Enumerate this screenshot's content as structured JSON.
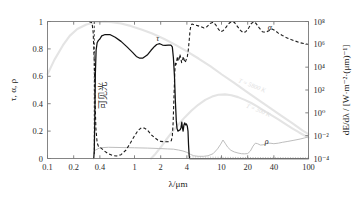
{
  "chart_data": {
    "type": "line",
    "title": "",
    "xlabel": "λ/μm",
    "ylabel_left": "τ, α, ρ",
    "ylabel_right": "dE/dλ / [W·m⁻²·(μm)⁻¹]",
    "xscale": "log",
    "xlim": [
      0.1,
      100
    ],
    "ylim_left": [
      0,
      1
    ],
    "ylim_right": [
      0.0001,
      100000000.0
    ],
    "grid": false,
    "legend_position": "inline-annotations",
    "xticks": [
      "0.1",
      "0.2",
      "0.4",
      "1",
      "2",
      "4",
      "10",
      "20",
      "40",
      "100"
    ],
    "xtick_values": [
      0.1,
      0.2,
      0.4,
      1,
      2,
      4,
      10,
      20,
      40,
      100
    ],
    "yticks_left": [
      "0",
      "0.2",
      "0.4",
      "0.6",
      "0.8",
      "1"
    ],
    "ytick_values_left": [
      0,
      0.2,
      0.4,
      0.6,
      0.8,
      1
    ],
    "yticks_right": [
      "10⁻⁴",
      "10⁻²",
      "10⁰",
      "10²",
      "10⁴",
      "10⁶",
      "10⁸"
    ],
    "ytick_values_right": [
      0.0001,
      0.01,
      1,
      100,
      10000,
      1000000,
      100000000
    ],
    "annotations": [
      {
        "name": "tau-label",
        "text": "τ",
        "x": 1.85,
        "y": 0.855
      },
      {
        "name": "alpha-label",
        "text": "α",
        "x": 36,
        "y": 0.935
      },
      {
        "name": "rho-label",
        "text": "ρ",
        "x": 33,
        "y": 0.105
      },
      {
        "name": "visible-light-label",
        "text": "可见光",
        "x": 0.47,
        "y": 0.46
      },
      {
        "name": "blackbody-5800-label",
        "text": "T = 5800 K",
        "x": 22,
        "y": 0.52
      },
      {
        "name": "blackbody-300-label",
        "text": "T = 300 K",
        "x": 26,
        "y": 0.34
      }
    ],
    "series": [
      {
        "name": "τ",
        "symbol": "tau",
        "style": "solid",
        "color": "#111111",
        "description": "Spectral transmissivity of glass",
        "points": [
          [
            0.34,
            0.0
          ],
          [
            0.345,
            0.06
          ],
          [
            0.35,
            0.3
          ],
          [
            0.355,
            0.62
          ],
          [
            0.362,
            0.79
          ],
          [
            0.372,
            0.845
          ],
          [
            0.385,
            0.862
          ],
          [
            0.4,
            0.872
          ],
          [
            0.42,
            0.895
          ],
          [
            0.46,
            0.905
          ],
          [
            0.52,
            0.905
          ],
          [
            0.6,
            0.885
          ],
          [
            0.7,
            0.855
          ],
          [
            0.82,
            0.815
          ],
          [
            0.95,
            0.775
          ],
          [
            1.05,
            0.745
          ],
          [
            1.15,
            0.732
          ],
          [
            1.25,
            0.733
          ],
          [
            1.4,
            0.755
          ],
          [
            1.55,
            0.79
          ],
          [
            1.7,
            0.818
          ],
          [
            1.8,
            0.832
          ],
          [
            1.95,
            0.838
          ],
          [
            2.1,
            0.828
          ],
          [
            2.25,
            0.825
          ],
          [
            2.45,
            0.828
          ],
          [
            2.62,
            0.828
          ],
          [
            2.72,
            0.815
          ],
          [
            2.8,
            0.735
          ],
          [
            2.88,
            0.6
          ],
          [
            2.95,
            0.42
          ],
          [
            3.02,
            0.28
          ],
          [
            3.08,
            0.22
          ],
          [
            3.15,
            0.2
          ],
          [
            3.25,
            0.205
          ],
          [
            3.35,
            0.21
          ],
          [
            3.42,
            0.225
          ],
          [
            3.5,
            0.265
          ],
          [
            3.55,
            0.225
          ],
          [
            3.62,
            0.2
          ],
          [
            3.7,
            0.245
          ],
          [
            3.78,
            0.26
          ],
          [
            3.86,
            0.245
          ],
          [
            3.95,
            0.252
          ],
          [
            4.05,
            0.235
          ],
          [
            4.12,
            0.2
          ],
          [
            4.18,
            0.1
          ],
          [
            4.25,
            0.02
          ],
          [
            4.3,
            0.0
          ],
          [
            100,
            0.0
          ]
        ]
      },
      {
        "name": "α",
        "symbol": "alpha",
        "style": "dashed",
        "color": "#1a1a1a",
        "description": "Spectral absorptivity of glass",
        "points": [
          [
            0.3,
            1.0
          ],
          [
            0.325,
            0.99
          ],
          [
            0.335,
            0.92
          ],
          [
            0.345,
            0.7
          ],
          [
            0.352,
            0.42
          ],
          [
            0.36,
            0.22
          ],
          [
            0.372,
            0.115
          ],
          [
            0.385,
            0.088
          ],
          [
            0.4,
            0.082
          ],
          [
            0.42,
            0.072
          ],
          [
            0.45,
            0.055
          ],
          [
            0.5,
            0.035
          ],
          [
            0.56,
            0.022
          ],
          [
            0.62,
            0.018
          ],
          [
            0.7,
            0.028
          ],
          [
            0.8,
            0.062
          ],
          [
            0.9,
            0.115
          ],
          [
            1.0,
            0.165
          ],
          [
            1.1,
            0.205
          ],
          [
            1.2,
            0.225
          ],
          [
            1.3,
            0.222
          ],
          [
            1.42,
            0.205
          ],
          [
            1.55,
            0.175
          ],
          [
            1.7,
            0.152
          ],
          [
            1.85,
            0.135
          ],
          [
            2.0,
            0.125
          ],
          [
            2.2,
            0.122
          ],
          [
            2.4,
            0.122
          ],
          [
            2.55,
            0.125
          ],
          [
            2.65,
            0.13
          ],
          [
            2.72,
            0.165
          ],
          [
            2.78,
            0.26
          ],
          [
            2.84,
            0.44
          ],
          [
            2.9,
            0.62
          ],
          [
            2.95,
            0.705
          ],
          [
            3.0,
            0.685
          ],
          [
            3.06,
            0.715
          ],
          [
            3.12,
            0.745
          ],
          [
            3.18,
            0.712
          ],
          [
            3.25,
            0.72
          ],
          [
            3.32,
            0.76
          ],
          [
            3.4,
            0.735
          ],
          [
            3.48,
            0.7
          ],
          [
            3.56,
            0.715
          ],
          [
            3.64,
            0.745
          ],
          [
            3.72,
            0.72
          ],
          [
            3.82,
            0.7
          ],
          [
            3.92,
            0.72
          ],
          [
            4.05,
            0.745
          ],
          [
            4.15,
            0.79
          ],
          [
            4.25,
            0.86
          ],
          [
            4.35,
            0.935
          ],
          [
            4.45,
            0.972
          ],
          [
            4.6,
            0.982
          ],
          [
            4.9,
            0.975
          ],
          [
            5.3,
            0.97
          ],
          [
            5.8,
            0.962
          ],
          [
            6.3,
            0.952
          ],
          [
            6.8,
            0.962
          ],
          [
            7.4,
            0.985
          ],
          [
            8.0,
            0.995
          ],
          [
            8.6,
            0.975
          ],
          [
            9.2,
            0.945
          ],
          [
            9.8,
            0.925
          ],
          [
            10.5,
            0.935
          ],
          [
            11.2,
            0.955
          ],
          [
            12.0,
            0.982
          ],
          [
            13.0,
            1.0
          ],
          [
            14.0,
            0.995
          ],
          [
            15.2,
            0.965
          ],
          [
            16.5,
            0.935
          ],
          [
            17.8,
            0.918
          ],
          [
            19.0,
            0.925
          ],
          [
            20.5,
            0.952
          ],
          [
            22.0,
            0.985
          ],
          [
            23.5,
            0.998
          ],
          [
            25.0,
            0.985
          ],
          [
            27.0,
            0.955
          ],
          [
            29.5,
            0.925
          ],
          [
            32.0,
            0.922
          ],
          [
            35.0,
            0.932
          ],
          [
            38.0,
            0.945
          ],
          [
            41.0,
            0.935
          ],
          [
            45.0,
            0.915
          ],
          [
            50.0,
            0.898
          ],
          [
            56.0,
            0.882
          ],
          [
            63.0,
            0.868
          ],
          [
            70.0,
            0.858
          ],
          [
            80.0,
            0.845
          ],
          [
            90.0,
            0.838
          ],
          [
            100.0,
            0.832
          ]
        ]
      },
      {
        "name": "ρ",
        "symbol": "rho",
        "style": "solid-light",
        "color": "#b9b9b9",
        "description": "Spectral reflectivity of glass",
        "points": [
          [
            0.34,
            0.055
          ],
          [
            0.4,
            0.078
          ],
          [
            0.5,
            0.082
          ],
          [
            0.7,
            0.08
          ],
          [
            1.0,
            0.078
          ],
          [
            1.4,
            0.076
          ],
          [
            1.9,
            0.073
          ],
          [
            2.4,
            0.07
          ],
          [
            2.8,
            0.068
          ],
          [
            3.2,
            0.062
          ],
          [
            3.6,
            0.055
          ],
          [
            4.0,
            0.045
          ],
          [
            4.4,
            0.03
          ],
          [
            4.8,
            0.02
          ],
          [
            5.4,
            0.016
          ],
          [
            6.2,
            0.016
          ],
          [
            7.0,
            0.02
          ],
          [
            8.0,
            0.035
          ],
          [
            9.0,
            0.07
          ],
          [
            9.8,
            0.105
          ],
          [
            10.4,
            0.135
          ],
          [
            11.0,
            0.112
          ],
          [
            11.8,
            0.082
          ],
          [
            12.8,
            0.06
          ],
          [
            14.0,
            0.048
          ],
          [
            15.5,
            0.04
          ],
          [
            17.0,
            0.035
          ],
          [
            18.5,
            0.034
          ],
          [
            20.0,
            0.036
          ],
          [
            21.5,
            0.055
          ],
          [
            23.0,
            0.09
          ],
          [
            24.5,
            0.112
          ],
          [
            26.0,
            0.108
          ],
          [
            28.0,
            0.098
          ],
          [
            30.0,
            0.1
          ],
          [
            33.0,
            0.108
          ],
          [
            36.0,
            0.112
          ],
          [
            40.0,
            0.108
          ],
          [
            45.0,
            0.112
          ],
          [
            50.0,
            0.118
          ],
          [
            58.0,
            0.125
          ],
          [
            68.0,
            0.133
          ],
          [
            80.0,
            0.142
          ],
          [
            90.0,
            0.15
          ],
          [
            100.0,
            0.158
          ]
        ]
      },
      {
        "name": "T = 5800 K",
        "symbol": "blackbody_5800",
        "style": "faint-gray",
        "color": "#e4e4e4",
        "description": "Spectral emissive power of blackbody at 5800 K (right axis)",
        "points": [
          [
            0.1,
            0.615
          ],
          [
            0.12,
            0.72
          ],
          [
            0.15,
            0.825
          ],
          [
            0.18,
            0.895
          ],
          [
            0.22,
            0.945
          ],
          [
            0.28,
            0.978
          ],
          [
            0.35,
            0.993
          ],
          [
            0.45,
            0.998
          ],
          [
            0.55,
            0.995
          ],
          [
            0.7,
            0.985
          ],
          [
            0.9,
            0.968
          ],
          [
            1.2,
            0.942
          ],
          [
            1.6,
            0.912
          ],
          [
            2.2,
            0.872
          ],
          [
            3.0,
            0.828
          ],
          [
            4.0,
            0.782
          ],
          [
            5.5,
            0.728
          ],
          [
            7.5,
            0.672
          ],
          [
            10.0,
            0.615
          ],
          [
            14.0,
            0.552
          ],
          [
            19.0,
            0.492
          ],
          [
            26.0,
            0.432
          ],
          [
            35.0,
            0.375
          ],
          [
            48.0,
            0.315
          ],
          [
            65.0,
            0.258
          ],
          [
            85.0,
            0.205
          ],
          [
            100.0,
            0.178
          ]
        ]
      },
      {
        "name": "T = 300 K",
        "symbol": "blackbody_300",
        "style": "faint-gray",
        "color": "#e4e4e4",
        "description": "Spectral emissive power of blackbody at 300 K (right axis)",
        "points": [
          [
            1.55,
            0.0
          ],
          [
            1.75,
            0.035
          ],
          [
            2.0,
            0.082
          ],
          [
            2.3,
            0.135
          ],
          [
            2.7,
            0.192
          ],
          [
            3.2,
            0.248
          ],
          [
            3.8,
            0.302
          ],
          [
            4.5,
            0.348
          ],
          [
            5.4,
            0.392
          ],
          [
            6.5,
            0.428
          ],
          [
            7.8,
            0.452
          ],
          [
            9.2,
            0.465
          ],
          [
            11.0,
            0.468
          ],
          [
            13.0,
            0.462
          ],
          [
            15.5,
            0.448
          ],
          [
            18.5,
            0.428
          ],
          [
            22.0,
            0.405
          ],
          [
            26.0,
            0.378
          ],
          [
            31.0,
            0.348
          ],
          [
            37.0,
            0.318
          ],
          [
            45.0,
            0.285
          ],
          [
            54.0,
            0.252
          ],
          [
            65.0,
            0.22
          ],
          [
            78.0,
            0.19
          ],
          [
            90.0,
            0.168
          ],
          [
            100.0,
            0.152
          ]
        ]
      }
    ],
    "visible_band": {
      "name": "visible-light-band",
      "label": "可见光",
      "x_min": 0.38,
      "x_max": 0.76,
      "marker_x": 0.345
    }
  },
  "figure": {
    "background_color": "#ffffff",
    "axis_color": "#777777",
    "text_color": "#1a1a1a"
  }
}
